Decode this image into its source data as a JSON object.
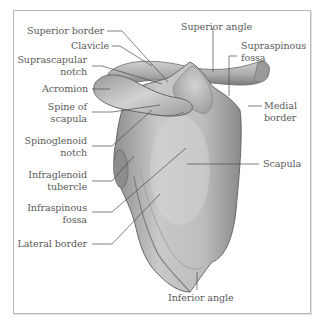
{
  "figure": {
    "colors": {
      "background": "#ffffff",
      "frame": "#b9b9b9",
      "bone_light": "#d6d6d6",
      "bone_mid": "#a9a9a9",
      "bone_dark": "#6e6e6e",
      "leader_line": "#4a4a4a",
      "label_text": "#5a5a5a"
    },
    "labels_left": [
      {
        "id": "superior-border",
        "text": "Superior border"
      },
      {
        "id": "clavicle",
        "text": "Clavicle"
      },
      {
        "id": "suprascapular-notch",
        "text": "Suprascapular\nnotch"
      },
      {
        "id": "acromion",
        "text": "Acromion"
      },
      {
        "id": "spine-of-scapula",
        "text": "Spine of\nscapula"
      },
      {
        "id": "spinoglenoid-notch",
        "text": "Spinoglenoid\nnotch"
      },
      {
        "id": "infraglenoid-tubercle",
        "text": "Infraglenoid\ntubercle"
      },
      {
        "id": "infraspinous-fossa",
        "text": "Infraspinous\nfossa"
      },
      {
        "id": "lateral-border",
        "text": "Lateral border"
      }
    ],
    "labels_right": [
      {
        "id": "superior-angle",
        "text": "Superior angle"
      },
      {
        "id": "supraspinous-fossa",
        "text": "Supraspinous\nfossa"
      },
      {
        "id": "medial-border",
        "text": "Medial\nborder"
      },
      {
        "id": "scapula",
        "text": "Scapula"
      }
    ],
    "labels_bottom": [
      {
        "id": "inferior-angle",
        "text": "Inferior angle"
      }
    ]
  }
}
